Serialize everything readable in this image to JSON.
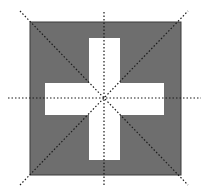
{
  "diagram": {
    "colors": {
      "square_fill": "#6e6e6e",
      "square_stroke": "#3a3a3a",
      "cross_fill": "#ffffff",
      "symmetry_line": "#1a1a1a",
      "background": "#ffffff"
    },
    "square": {
      "x": 30,
      "y": 22,
      "width": 151,
      "height": 153
    },
    "cross": {
      "vertical_bar": {
        "x": 89,
        "y": 38,
        "width": 31,
        "height": 122
      },
      "horizontal_bar": {
        "x": 45,
        "y": 83,
        "width": 119,
        "height": 32
      }
    },
    "symmetry_lines": [
      {
        "name": "vertical",
        "x1": 104,
        "y1": 12,
        "x2": 104,
        "y2": 186
      },
      {
        "name": "horizontal",
        "x1": 8,
        "y1": 98,
        "x2": 201,
        "y2": 98
      },
      {
        "name": "diagonal-down",
        "x1": 20,
        "y1": 11,
        "x2": 188,
        "y2": 185
      },
      {
        "name": "diagonal-up",
        "x1": 20,
        "y1": 185,
        "x2": 188,
        "y2": 11
      }
    ],
    "symmetry_line_count": 4
  }
}
